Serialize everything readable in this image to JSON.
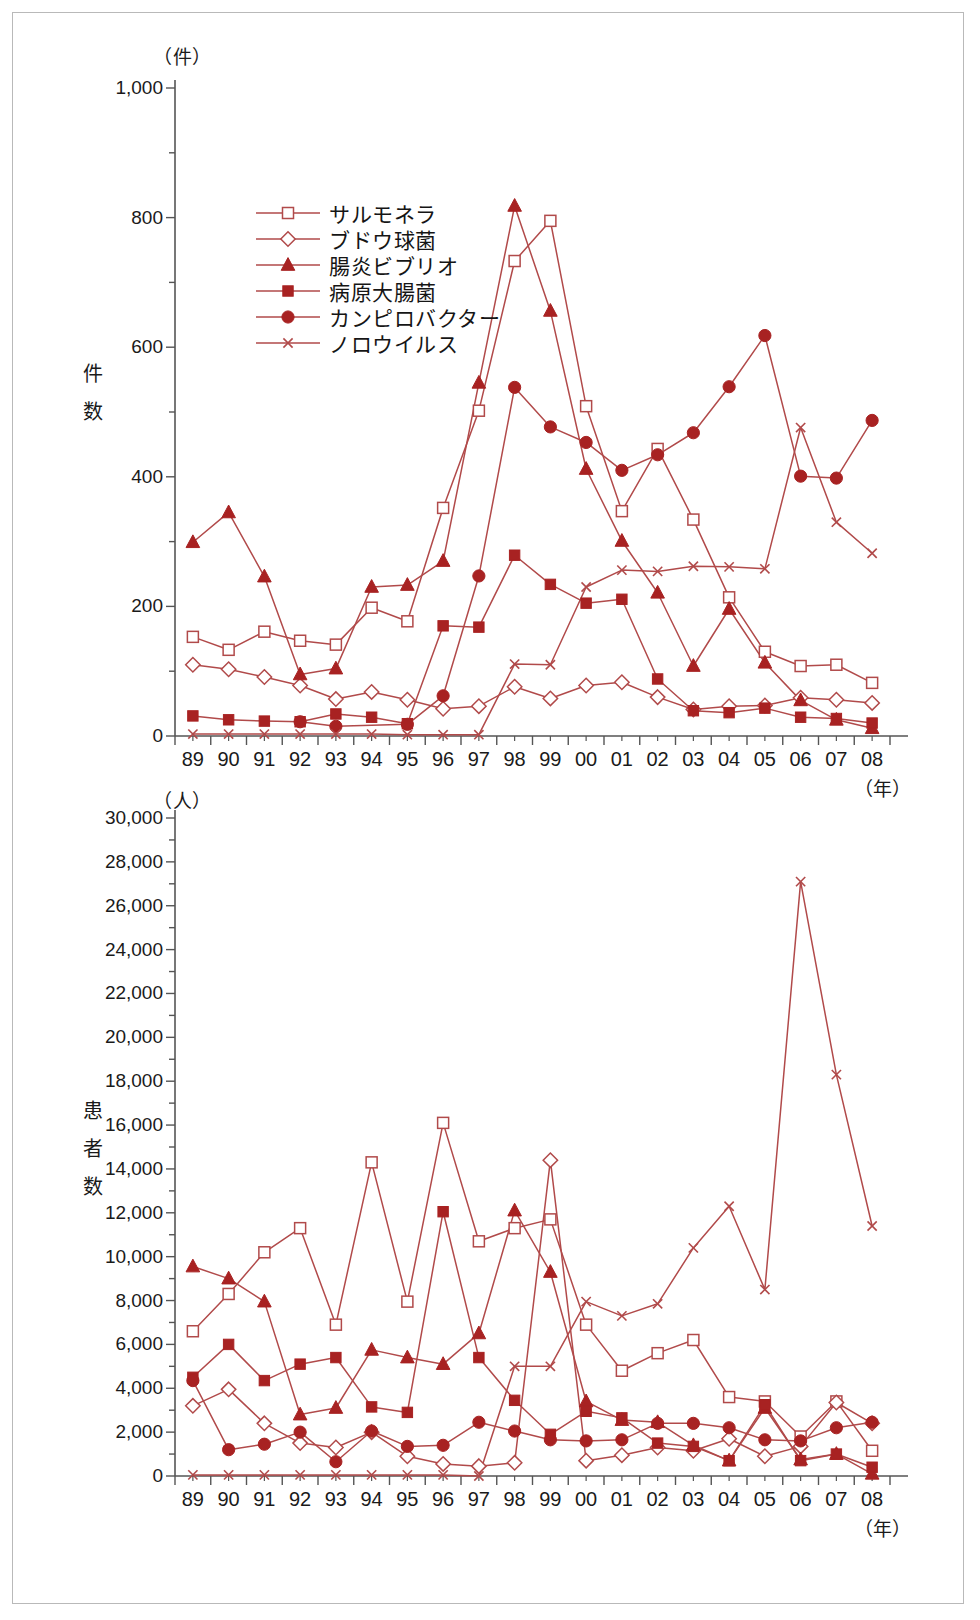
{
  "accent_color": "#a82222",
  "line_color": "#b14a4a",
  "axis_color": "#555555",
  "frame_color": "#b9b9b9",
  "charts": [
    {
      "id": "chart-top",
      "unit_label": "（件）",
      "axis_title": "件数",
      "axis_title_chars": [
        "件",
        "数"
      ],
      "x_unit_label": "（年）",
      "ylim": [
        0,
        1000
      ],
      "yticks": [
        0,
        200,
        400,
        600,
        800,
        1000
      ],
      "ytick_labels": [
        "0",
        "200",
        "400",
        "600",
        "800",
        "1,000"
      ],
      "yminor_step": 100,
      "legend_position": "upper-left-inside"
    },
    {
      "id": "chart-bottom",
      "unit_label": "（人）",
      "axis_title": "患者数",
      "axis_title_chars": [
        "患",
        "者",
        "数"
      ],
      "x_unit_label": "（年）",
      "ylim": [
        0,
        30000
      ],
      "yticks": [
        0,
        2000,
        4000,
        6000,
        8000,
        10000,
        12000,
        14000,
        16000,
        18000,
        20000,
        22000,
        24000,
        26000,
        28000,
        30000
      ],
      "ytick_labels": [
        "0",
        "2,000",
        "4,000",
        "6,000",
        "8,000",
        "10,000",
        "12,000",
        "14,000",
        "16,000",
        "18,000",
        "20,000",
        "22,000",
        "24,000",
        "26,000",
        "28,000",
        "30,000"
      ],
      "yminor_step": 1000,
      "legend_position": "none"
    }
  ],
  "legend": {
    "items": [
      {
        "label": "サルモネラ",
        "marker": "open-square",
        "key": "salmonella"
      },
      {
        "label": "ブドウ球菌",
        "marker": "open-diamond",
        "key": "staphylococcus"
      },
      {
        "label": "腸炎ビブリオ",
        "marker": "filled-triangle",
        "key": "vibrio"
      },
      {
        "label": "病原大腸菌",
        "marker": "filled-square",
        "key": "ecoli"
      },
      {
        "label": "カンピロバクター",
        "marker": "filled-circle",
        "key": "campylobacter"
      },
      {
        "label": "ノロウイルス",
        "marker": "cross",
        "key": "norovirus"
      }
    ]
  },
  "chart_data": [
    {
      "type": "line",
      "title": "",
      "xlabel": "（年）",
      "ylabel": "件数",
      "yunit": "（件）",
      "ylim": [
        0,
        1000
      ],
      "grid": false,
      "legend_position": "upper-left",
      "categories": [
        "89",
        "90",
        "91",
        "92",
        "93",
        "94",
        "95",
        "96",
        "97",
        "98",
        "99",
        "00",
        "01",
        "02",
        "03",
        "04",
        "05",
        "06",
        "07",
        "08"
      ],
      "series": [
        {
          "name": "サルモネラ",
          "marker": "open-square",
          "values": [
            153,
            133,
            161,
            147,
            141,
            198,
            177,
            352,
            502,
            733,
            795,
            509,
            347,
            443,
            334,
            214,
            130,
            108,
            110,
            82
          ]
        },
        {
          "name": "ブドウ球菌",
          "marker": "open-diamond",
          "values": [
            110,
            103,
            91,
            78,
            57,
            68,
            56,
            42,
            46,
            76,
            58,
            78,
            83,
            60,
            41,
            46,
            47,
            59,
            56,
            51
          ]
        },
        {
          "name": "腸炎ビブリオ",
          "marker": "filled-triangle",
          "values": [
            299,
            345,
            246,
            95,
            104,
            230,
            233,
            270,
            545,
            818,
            656,
            412,
            301,
            221,
            108,
            196,
            113,
            55,
            25,
            12
          ]
        },
        {
          "name": "病原大腸菌",
          "marker": "filled-square",
          "values": [
            31,
            25,
            23,
            22,
            34,
            29,
            19,
            170,
            168,
            279,
            234,
            205,
            211,
            88,
            39,
            36,
            43,
            29,
            27,
            20
          ]
        },
        {
          "name": "カンピロバクター",
          "marker": "filled-circle",
          "values": [
            null,
            null,
            null,
            22,
            15,
            null,
            18,
            62,
            247,
            538,
            477,
            453,
            410,
            434,
            468,
            539,
            618,
            401,
            398,
            487
          ]
        },
        {
          "name": "ノロウイルス",
          "marker": "cross",
          "values": [
            3,
            3,
            3,
            3,
            3,
            3,
            2,
            2,
            2,
            111,
            110,
            230,
            256,
            254,
            262,
            261,
            258,
            476,
            330,
            282
          ]
        }
      ]
    },
    {
      "type": "line",
      "title": "",
      "xlabel": "（年）",
      "ylabel": "患者数",
      "yunit": "（人）",
      "ylim": [
        0,
        30000
      ],
      "grid": false,
      "legend_position": "none",
      "categories": [
        "89",
        "90",
        "91",
        "92",
        "93",
        "94",
        "95",
        "96",
        "97",
        "98",
        "99",
        "00",
        "01",
        "02",
        "03",
        "04",
        "05",
        "06",
        "07",
        "08"
      ],
      "series": [
        {
          "name": "サルモネラ",
          "marker": "open-square",
          "values": [
            6600,
            8300,
            10200,
            11300,
            6900,
            14300,
            7950,
            16100,
            10700,
            11300,
            11700,
            6900,
            4800,
            5600,
            6200,
            3600,
            3400,
            1800,
            3400,
            1150
          ]
        },
        {
          "name": "ブドウ球菌",
          "marker": "open-diamond",
          "values": [
            3200,
            3950,
            2400,
            1500,
            1300,
            2000,
            900,
            550,
            450,
            600,
            14400,
            700,
            950,
            1300,
            1150,
            1700,
            900,
            1350,
            3350,
            2400
          ]
        },
        {
          "name": "腸炎ビブリオ",
          "marker": "filled-triangle",
          "values": [
            9550,
            9000,
            7950,
            2800,
            3100,
            5750,
            5400,
            5100,
            6500,
            12100,
            9300,
            3400,
            2550,
            2450,
            1400,
            700,
            3100,
            750,
            1000,
            100
          ]
        },
        {
          "name": "病原大腸菌",
          "marker": "filled-square",
          "values": [
            4500,
            6000,
            4350,
            5100,
            5400,
            3150,
            2900,
            12050,
            5400,
            3450,
            1900,
            2950,
            2650,
            1500,
            1350,
            700,
            3250,
            700,
            1000,
            400
          ]
        },
        {
          "name": "カンピロバクター",
          "marker": "filled-circle",
          "values": [
            4350,
            1200,
            1450,
            2000,
            650,
            2050,
            1350,
            1400,
            2450,
            2050,
            1650,
            1600,
            1650,
            2400,
            2400,
            2200,
            1650,
            1600,
            2200,
            2450
          ]
        },
        {
          "name": "ノロウイルス",
          "marker": "cross",
          "values": [
            50,
            50,
            50,
            50,
            50,
            50,
            50,
            50,
            0,
            5000,
            5000,
            7950,
            7300,
            7850,
            10400,
            12300,
            8500,
            27100,
            18300,
            11400
          ]
        }
      ]
    }
  ]
}
